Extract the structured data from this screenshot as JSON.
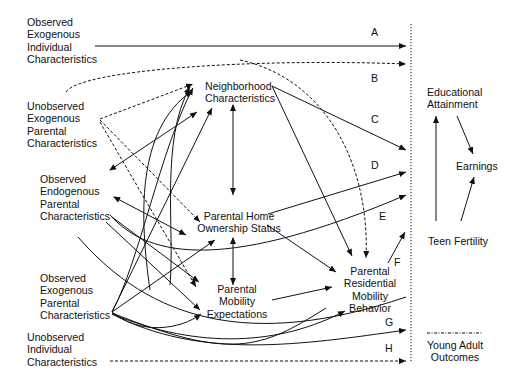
{
  "diagram": {
    "type": "causal path diagram",
    "nodes": {
      "obs_exo_individual": "Observed\nExogenous\nIndividual\nCharacteristics",
      "unobs_exo_parental": "Unobserved\nExogenous\nParental\nCharacteristics",
      "obs_endo_parental": "Observed\nEndogenous\nParental\nCharacteristics",
      "obs_exo_parental": "Observed\nExogenous\nParental\nCharacteristics",
      "unobs_individual": "Unobserved\nIndividual\nCharacteristics",
      "neighborhood": "Neighborhood\nCharacteristics",
      "home_ownership": "Parental Home\nOwnership Status",
      "mobility_expectations": "Parental\nMobility\nExpectations",
      "residential_mobility": "Parental\nResidential\nMobility\nBehavior",
      "educational_attainment": "Educational\nAttainment",
      "earnings": "Earnings",
      "teen_fertility": "Teen Fertility",
      "young_adult_outcomes": "Young Adult\nOutcomes"
    },
    "path_labels": [
      "A",
      "B",
      "C",
      "D",
      "E",
      "F",
      "G",
      "H"
    ],
    "legend": {
      "solid": "observed relationship",
      "dashed": "unobserved relationship"
    }
  }
}
